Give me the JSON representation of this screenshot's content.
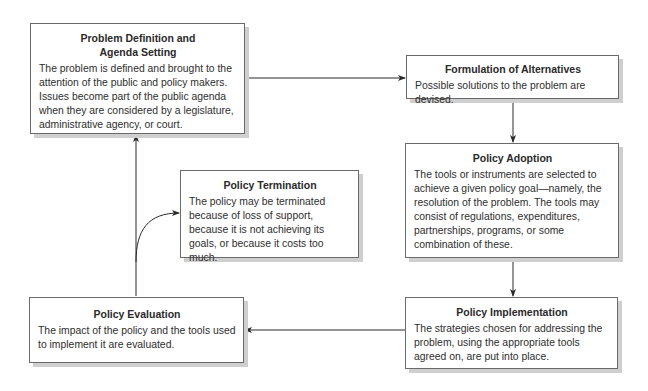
{
  "diagram": {
    "type": "policy-process-cycle",
    "nodes": [
      {
        "id": "problem_definition",
        "title": "Problem Definition and Agenda Setting",
        "title_lines": [
          "Problem Definition and",
          "Agenda Setting"
        ],
        "body": "The problem is defined and brought to the attention of the public and policy makers. Issues become part of the public agenda when they are considered by a legislature, administrative agency, or court."
      },
      {
        "id": "formulation",
        "title": "Formulation of Alternatives",
        "body": "Possible solutions to the problem are devised."
      },
      {
        "id": "adoption",
        "title": "Policy Adoption",
        "body": "The tools or instruments are selected to achieve a given policy goal—namely, the resolution of the problem. The tools may consist of regulations, expenditures, partnerships, programs, or some combination of these."
      },
      {
        "id": "implementation",
        "title": "Policy Implementation",
        "body": "The strategies chosen for addressing the problem, using the appropriate tools agreed on, are put into place."
      },
      {
        "id": "evaluation",
        "title": "Policy Evaluation",
        "body": "The impact of the policy and the tools used to implement it are evaluated."
      },
      {
        "id": "termination",
        "title": "Policy Termination",
        "body": "The policy may be terminated because of loss of support, because it is not achieving its goals, or because it costs too much."
      }
    ],
    "edges": [
      {
        "from": "problem_definition",
        "to": "formulation"
      },
      {
        "from": "formulation",
        "to": "adoption"
      },
      {
        "from": "adoption",
        "to": "implementation"
      },
      {
        "from": "implementation",
        "to": "evaluation"
      },
      {
        "from": "evaluation",
        "to": "problem_definition"
      },
      {
        "from": "evaluation",
        "to": "termination"
      }
    ],
    "colors": {
      "border": "#6a6a6a",
      "shadow": "#cfcfcf",
      "line": "#2a2a2a",
      "text": "#2a2a2a",
      "background": "#ffffff"
    }
  }
}
